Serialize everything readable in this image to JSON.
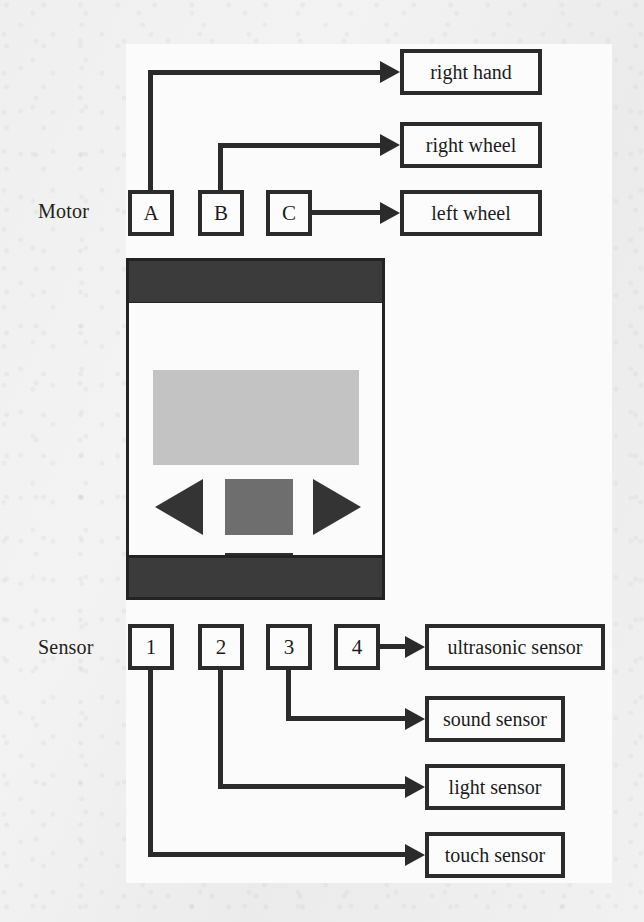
{
  "diagram": {
    "type": "block-diagram",
    "groups": [
      {
        "key": "motor",
        "label": "Motor"
      },
      {
        "key": "sensor",
        "label": "Sensor"
      }
    ],
    "motor_ports": [
      {
        "id": "A",
        "label": "A"
      },
      {
        "id": "B",
        "label": "B"
      },
      {
        "id": "C",
        "label": "C"
      }
    ],
    "motor_targets": [
      {
        "id": "right-hand",
        "label": "right hand"
      },
      {
        "id": "right-wheel",
        "label": "right wheel"
      },
      {
        "id": "left-wheel",
        "label": "left wheel"
      }
    ],
    "sensor_ports": [
      {
        "id": "1",
        "label": "1"
      },
      {
        "id": "2",
        "label": "2"
      },
      {
        "id": "3",
        "label": "3"
      },
      {
        "id": "4",
        "label": "4"
      }
    ],
    "sensor_targets": [
      {
        "id": "ultrasonic-sensor",
        "label": "ultrasonic sensor"
      },
      {
        "id": "sound-sensor",
        "label": "sound sensor"
      },
      {
        "id": "light-sensor",
        "label": "light sensor"
      },
      {
        "id": "touch-sensor",
        "label": "touch sensor"
      }
    ],
    "connections": [
      {
        "from": "A",
        "to": "right hand"
      },
      {
        "from": "B",
        "to": "right wheel"
      },
      {
        "from": "C",
        "to": "left wheel"
      },
      {
        "from": "4",
        "to": "ultrasonic sensor"
      },
      {
        "from": "3",
        "to": "sound sensor"
      },
      {
        "from": "2",
        "to": "light sensor"
      },
      {
        "from": "1",
        "to": "touch sensor"
      }
    ],
    "brick": {
      "name": "nxt-brick",
      "parts": [
        "top-band",
        "lcd-screen",
        "left-arrow-button",
        "center-button",
        "right-arrow-button",
        "gray-back-button",
        "bottom-band"
      ]
    },
    "colors": {
      "line": "#2b2b2b",
      "panel": "#fbfbfb",
      "page": "#f0f0f0",
      "brick_band": "#3b3b3b",
      "lcd": "#c3c3c3",
      "center_button": "#6e6e6e",
      "dark_button": "#2e2e2e"
    }
  }
}
